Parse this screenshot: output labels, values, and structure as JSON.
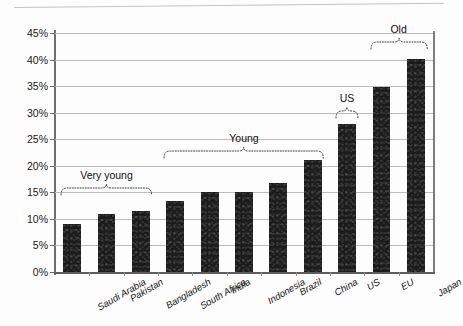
{
  "chart_data": {
    "type": "bar",
    "title": "",
    "xlabel": "",
    "ylabel": "",
    "categories": [
      "Saudi Arabia",
      "Pakistan",
      "Bangladesh",
      "South Africa",
      "India",
      "Indonesia",
      "Brazil",
      "China",
      "US",
      "EU",
      "Japan"
    ],
    "values": [
      9.0,
      10.9,
      11.4,
      13.4,
      15.0,
      15.0,
      16.7,
      21.0,
      27.8,
      34.8,
      40.2
    ],
    "ylim": [
      0,
      45
    ],
    "ytick_labels": [
      "0%",
      "5%",
      "10%",
      "15%",
      "20%",
      "25%",
      "30%",
      "35%",
      "40%",
      "45%"
    ],
    "ytick_values": [
      0,
      5,
      10,
      15,
      20,
      25,
      30,
      35,
      40,
      45
    ],
    "grid": true,
    "legend": "none",
    "bar_color": "#1c1c1c",
    "gridline_color": "#bdbdbd",
    "axis_color": "#6f6f6f",
    "annotations": [
      {
        "label": "Very young",
        "from": "Saudi Arabia",
        "to": "Bangladesh",
        "label_value": "16.5"
      },
      {
        "label": "Young",
        "from": "South Africa",
        "to": "China",
        "label_value": "23.5"
      },
      {
        "label": "US",
        "from": "US",
        "to": "US",
        "label_value": "31.0"
      },
      {
        "label": "Old",
        "from": "EU",
        "to": "Japan",
        "label_value": "44.0"
      }
    ]
  }
}
